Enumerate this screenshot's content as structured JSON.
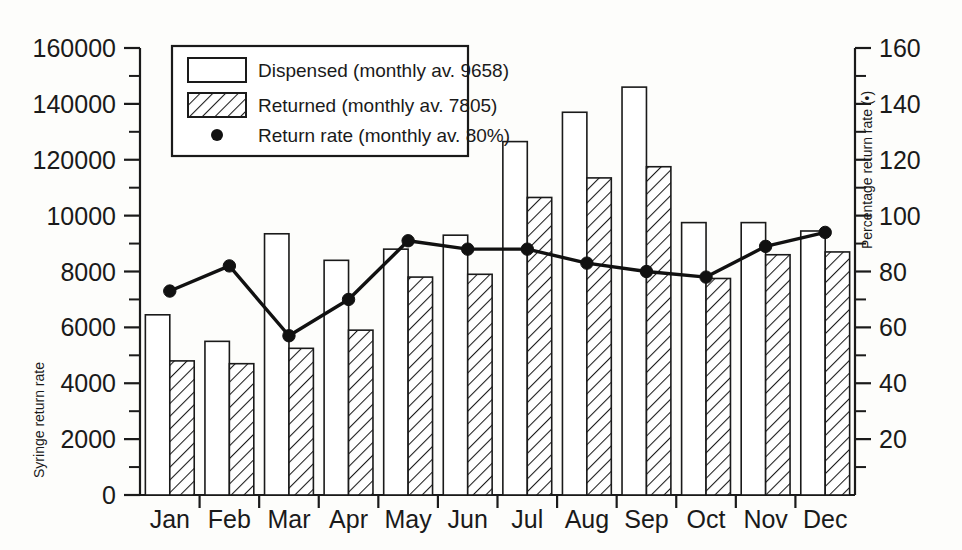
{
  "chart_data": {
    "type": "bar",
    "title": "",
    "subtitle": "",
    "xlabel": "",
    "ylabel": "Syringe return rate",
    "y2label": "Percentage return rate (•)",
    "grid": false,
    "legend_position": "top-left",
    "categories": [
      "Jan",
      "Feb",
      "Mar",
      "Apr",
      "May",
      "Jun",
      "Jul",
      "Aug",
      "Sep",
      "Oct",
      "Nov",
      "Dec"
    ],
    "ylim": [
      0,
      160000
    ],
    "y2lim": [
      0,
      160
    ],
    "y_tick_labels": [
      "0",
      "2000",
      "4000",
      "6000",
      "8000",
      "10000",
      "120000",
      "140000",
      "160000"
    ],
    "y_tick_values": [
      0,
      2000,
      4000,
      6000,
      8000,
      10000,
      12000,
      14000,
      16000
    ],
    "y2_tick_labels": [
      "20",
      "40",
      "60",
      "80",
      "100",
      "120",
      "140",
      "160"
    ],
    "y2_tick_values": [
      20,
      40,
      60,
      80,
      100,
      120,
      140,
      160
    ],
    "series": [
      {
        "name": "Dispensed",
        "legend_label": "Dispensed (monthly av. 9658)",
        "axis": "left",
        "style": "open-bar",
        "monthly_average": 9658,
        "values": [
          6450,
          5500,
          9350,
          8400,
          8800,
          9300,
          12650,
          13700,
          14600,
          9750,
          9750,
          9450
        ]
      },
      {
        "name": "Returned",
        "legend_label": "Returned (monthly av. 7805)",
        "axis": "left",
        "style": "hatched-bar",
        "monthly_average": 7805,
        "values": [
          4800,
          4700,
          5250,
          5900,
          7800,
          7900,
          10650,
          11350,
          11750,
          7750,
          8600,
          8700
        ]
      },
      {
        "name": "Return rate",
        "legend_label": "Return rate (monthly av. 80%)",
        "axis": "right",
        "style": "line-marker",
        "monthly_average": 80,
        "unit": "%",
        "values": [
          73,
          82,
          57,
          70,
          91,
          88,
          88,
          83,
          80,
          78,
          89,
          94
        ]
      }
    ]
  },
  "legend": {
    "entries": [
      {
        "label": "Dispensed (monthly av. 9658)",
        "marker": "open-square"
      },
      {
        "label": "Returned (monthly av. 7805)",
        "marker": "hatched-square"
      },
      {
        "label": "Return rate (monthly av. 80%)",
        "marker": "dot"
      }
    ]
  },
  "axes": {
    "left_title": "Syringe return rate",
    "right_title": "Percentage return rate (•)"
  },
  "colors": {
    "ink": "#1a1a1a",
    "paper": "#fdfdfb",
    "bar_fill": "#ffffff",
    "line": "#111111"
  }
}
